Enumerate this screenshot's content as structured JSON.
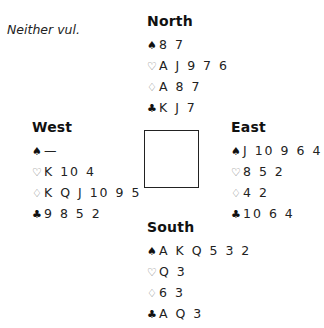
{
  "vulnerability": "Neither vul.",
  "suit_symbols": {
    "spades": "♠",
    "hearts": "♡",
    "diamonds": "♢",
    "clubs": "♣"
  },
  "hands": {
    "north": {
      "name": "North",
      "spades": "8 7",
      "hearts": "A J 9 7 6",
      "diamonds": "A 8 7",
      "clubs": "K J 7"
    },
    "west": {
      "name": "West",
      "spades": "—",
      "hearts": "K 10 4",
      "diamonds": "K Q J 10 9 5",
      "clubs": "9 8 5 2"
    },
    "east": {
      "name": "East",
      "spades": "J 10 9 6 4",
      "hearts": "8 5 2",
      "diamonds": "4 2",
      "clubs": "10 6 4"
    },
    "south": {
      "name": "South",
      "spades": "A K Q 5 3 2",
      "hearts": "Q 3",
      "diamonds": "6 3",
      "clubs": "A Q 3"
    }
  }
}
